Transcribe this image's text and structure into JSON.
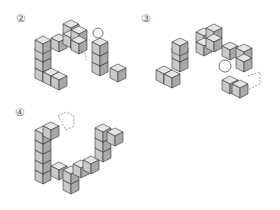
{
  "figures": [
    {
      "label": "②",
      "x": 17,
      "y": 10
    },
    {
      "label": "③",
      "x": 142,
      "y": 10
    },
    {
      "label": "④",
      "x": 16,
      "y": 107
    }
  ],
  "colors": {
    "top": "#e6e6e6",
    "left": "#c8c8c8",
    "right": "#a8a8a8",
    "stroke": "#333333",
    "dash": "#555555"
  }
}
